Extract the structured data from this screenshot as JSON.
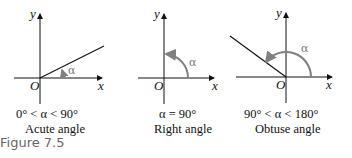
{
  "figure_label": "Figure 7.5",
  "panels": [
    {
      "axis_x": "x",
      "axis_y": "y",
      "origin": "O",
      "angle_symbol": "α",
      "condition": "0° < α < 90°",
      "name": "Acute angle"
    },
    {
      "axis_x": "x",
      "axis_y": "y",
      "origin": "O",
      "angle_symbol": "α",
      "condition": "α = 90°",
      "name": "Right angle"
    },
    {
      "axis_x": "x",
      "axis_y": "y",
      "origin": "O",
      "angle_symbol": "α",
      "condition": "90° < α < 180°",
      "name": "Obtuse angle"
    }
  ],
  "colors": {
    "axis": "#111111",
    "arc": "#808080"
  }
}
